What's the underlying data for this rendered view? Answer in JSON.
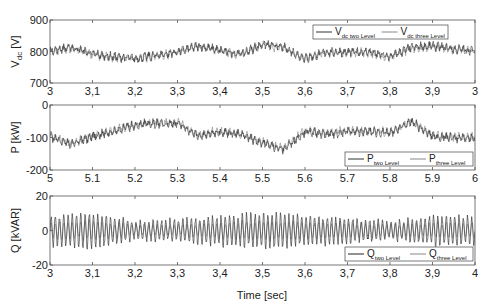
{
  "chart_data": [
    {
      "type": "line",
      "panel": "top",
      "title": "",
      "ylabel": "V_dc [V]",
      "ylabel_main": "V",
      "ylabel_sub": "dc",
      "ylabel_unit": " [V]",
      "xlabel": "",
      "xlim": [
        3.0,
        4.0
      ],
      "ylim": [
        700,
        900
      ],
      "yticks": [
        "900",
        "800",
        "700"
      ],
      "xticks": [
        "3",
        "3,1",
        "3,2",
        "3,3",
        "3,4",
        "3,5",
        "3,6",
        "3,7",
        "3,8",
        "3,9",
        "3"
      ],
      "legend": {
        "position": "upper right",
        "entries": [
          {
            "main": "V",
            "sub": "dc two Level"
          },
          {
            "main": "V",
            "sub": "dc three Level"
          }
        ]
      },
      "series": [
        {
          "name": "V_dc two Level",
          "color": "#333333",
          "x": [
            3.0,
            3.05,
            3.1,
            3.15,
            3.2,
            3.25,
            3.3,
            3.35,
            3.4,
            3.45,
            3.5,
            3.55,
            3.6,
            3.65,
            3.7,
            3.75,
            3.8,
            3.85,
            3.9,
            3.95,
            4.0
          ],
          "values": [
            805,
            815,
            795,
            785,
            780,
            790,
            800,
            820,
            805,
            795,
            825,
            815,
            780,
            800,
            800,
            800,
            785,
            815,
            820,
            810,
            805
          ]
        },
        {
          "name": "V_dc three Level",
          "color": "#888888",
          "x": [
            3.0,
            3.05,
            3.1,
            3.15,
            3.2,
            3.25,
            3.3,
            3.35,
            3.4,
            3.45,
            3.5,
            3.55,
            3.6,
            3.65,
            3.7,
            3.75,
            3.8,
            3.85,
            3.9,
            3.95,
            4.0
          ],
          "values": [
            800,
            812,
            792,
            782,
            778,
            788,
            798,
            818,
            802,
            792,
            822,
            812,
            778,
            798,
            798,
            798,
            782,
            812,
            818,
            808,
            802
          ]
        }
      ],
      "grid": false
    },
    {
      "type": "line",
      "panel": "middle",
      "ylabel": "P [kW]",
      "xlabel": "",
      "xlim": [
        5.0,
        6.0
      ],
      "ylim": [
        -200,
        0
      ],
      "yticks": [
        "0",
        "-100",
        "-200"
      ],
      "xticks": [
        "5",
        "5.1",
        "5.2",
        "5.3",
        "5.4",
        "5.5",
        "5.6",
        "5.7",
        "5.8",
        "5.9",
        "6"
      ],
      "legend": {
        "position": "lower right",
        "entries": [
          {
            "main": "P",
            "sub": "two Level"
          },
          {
            "main": "P",
            "sub": "three Level"
          }
        ]
      },
      "series": [
        {
          "name": "P two Level",
          "color": "#333333",
          "x": [
            5.0,
            5.05,
            5.1,
            5.15,
            5.2,
            5.25,
            5.3,
            5.35,
            5.4,
            5.45,
            5.5,
            5.55,
            5.6,
            5.65,
            5.7,
            5.75,
            5.8,
            5.85,
            5.9,
            5.95,
            6.0
          ],
          "values": [
            -95,
            -120,
            -95,
            -80,
            -60,
            -55,
            -55,
            -95,
            -80,
            -90,
            -115,
            -135,
            -80,
            -90,
            -80,
            -80,
            -85,
            -50,
            -95,
            -100,
            -100
          ]
        },
        {
          "name": "P three Level",
          "color": "#888888",
          "x": [
            5.0,
            5.05,
            5.1,
            5.15,
            5.2,
            5.25,
            5.3,
            5.35,
            5.4,
            5.45,
            5.5,
            5.55,
            5.6,
            5.65,
            5.7,
            5.75,
            5.8,
            5.85,
            5.9,
            5.95,
            6.0
          ],
          "values": [
            -92,
            -117,
            -92,
            -77,
            -57,
            -52,
            -52,
            -92,
            -77,
            -87,
            -112,
            -132,
            -77,
            -87,
            -77,
            -77,
            -82,
            -47,
            -92,
            -97,
            -97
          ]
        }
      ],
      "grid": false
    },
    {
      "type": "line",
      "panel": "bottom",
      "ylabel": "Q [kVAR]",
      "xlabel": "Time [sec]",
      "xlim": [
        3.0,
        4.0
      ],
      "ylim": [
        -20,
        20
      ],
      "yticks": [
        "20",
        "0",
        "-20"
      ],
      "xticks": [
        "3",
        "3,1",
        "3,2",
        "3,3",
        "3,4",
        "3,5",
        "3,6",
        "3,7",
        "3,8",
        "3,9",
        "4"
      ],
      "legend": {
        "position": "lower right",
        "entries": [
          {
            "main": "Q",
            "sub": "two Level"
          },
          {
            "main": "Q",
            "sub": "three Level"
          }
        ]
      },
      "series": [
        {
          "name": "Q two Level",
          "color": "#222222",
          "description": "oscillation ~100 Hz about 0",
          "x": [
            3.0,
            3.1,
            3.2,
            3.3,
            3.4,
            3.5,
            3.6,
            3.7,
            3.8,
            3.9,
            4.0
          ],
          "amplitude": [
            8,
            10,
            5,
            6,
            8,
            10,
            8,
            7,
            5,
            8,
            8
          ]
        },
        {
          "name": "Q three Level",
          "color": "#888888",
          "description": "oscillation ~100 Hz about 0, smaller amplitude",
          "x": [
            3.0,
            3.1,
            3.2,
            3.3,
            3.4,
            3.5,
            3.6,
            3.7,
            3.8,
            3.9,
            4.0
          ],
          "amplitude": [
            4,
            5,
            3,
            3,
            4,
            5,
            4,
            4,
            3,
            4,
            4
          ]
        }
      ],
      "grid": false
    }
  ]
}
